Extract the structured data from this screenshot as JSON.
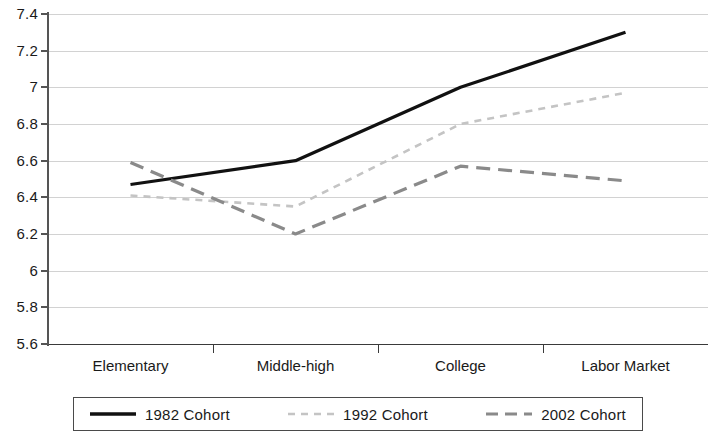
{
  "chart_data": {
    "type": "line",
    "title": "",
    "xlabel": "",
    "ylabel": "",
    "categories": [
      "Elementary",
      "Middle-high",
      "College",
      "Labor Market"
    ],
    "ylim": [
      5.6,
      7.4
    ],
    "yticks": [
      "5.6",
      "5.8",
      "6",
      "6.2",
      "6.4",
      "6.6",
      "6.8",
      "7",
      "7.2",
      "7.4"
    ],
    "ytick_values": [
      5.6,
      5.8,
      6,
      6.2,
      6.4,
      6.6,
      6.8,
      7,
      7.2,
      7.4
    ],
    "grid": true,
    "legend_position": "bottom",
    "series": [
      {
        "name": "1982 Cohort",
        "values": [
          6.47,
          6.6,
          7.0,
          7.3
        ],
        "color": "#111111",
        "style": "solid",
        "width": 3.2,
        "dash": ""
      },
      {
        "name": "1992 Cohort",
        "values": [
          6.41,
          6.35,
          6.8,
          6.97
        ],
        "color": "#c4c4c4",
        "style": "dashed-fine",
        "width": 2.6,
        "dash": "7,6"
      },
      {
        "name": "2002 Cohort",
        "values": [
          6.59,
          6.2,
          6.57,
          6.49
        ],
        "color": "#8a8a8a",
        "style": "dashed-long",
        "width": 3.2,
        "dash": "14,8"
      }
    ]
  },
  "legend": {
    "entries": [
      {
        "label": "1982 Cohort"
      },
      {
        "label": "1992 Cohort"
      },
      {
        "label": "2002 Cohort"
      }
    ]
  }
}
